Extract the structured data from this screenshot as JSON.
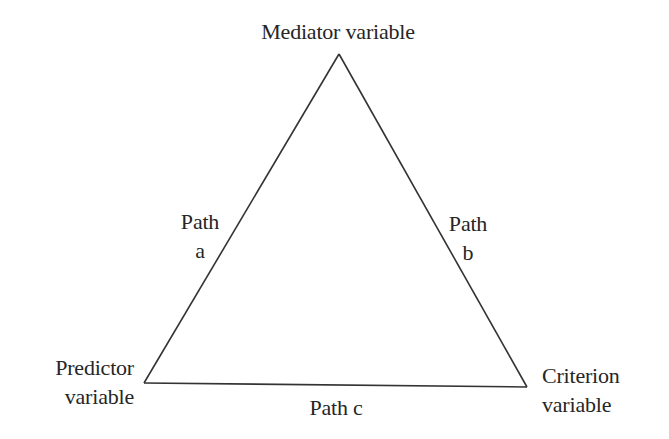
{
  "diagram": {
    "type": "mediation-triangle",
    "nodes": {
      "mediator": {
        "label": "Mediator variable"
      },
      "predictor": {
        "lines": [
          "Predictor",
          "variable"
        ]
      },
      "criterion": {
        "lines": [
          "Criterion",
          "variable"
        ]
      }
    },
    "edges": {
      "path_a": {
        "lines": [
          "Path",
          "a"
        ],
        "from": "Predictor variable",
        "to": "Mediator variable"
      },
      "path_b": {
        "lines": [
          "Path",
          "b"
        ],
        "from": "Mediator variable",
        "to": "Criterion variable"
      },
      "path_c": {
        "label": "Path c",
        "from": "Predictor variable",
        "to": "Criterion variable"
      }
    },
    "colors": {
      "background": "#ffffff",
      "line": "#333333",
      "text": "#262626"
    }
  }
}
